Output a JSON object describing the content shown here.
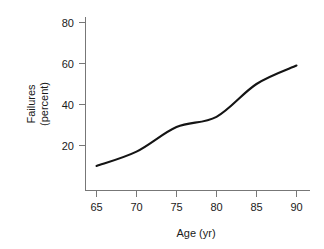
{
  "chart_data": {
    "type": "line",
    "title": "",
    "subtitle": "",
    "xlabel": "Age (yr)",
    "ylabel": "Failures (percent)",
    "ylabel_lines": [
      "Failures",
      "(percent)"
    ],
    "x": [
      65,
      70,
      75,
      80,
      85,
      90
    ],
    "values": [
      10,
      17,
      29,
      34,
      50,
      59
    ],
    "series": [
      {
        "name": "Failures",
        "values": [
          10,
          17,
          29,
          34,
          50,
          59
        ],
        "color": "#141414"
      }
    ],
    "xlim": [
      63,
      91
    ],
    "ylim": [
      5,
      85
    ],
    "xticks": [
      65,
      70,
      75,
      80,
      85,
      90
    ],
    "yticks": [
      20,
      40,
      60,
      80
    ],
    "xtick_labels": [
      "65",
      "70",
      "75",
      "80",
      "85",
      "90"
    ],
    "ytick_labels": [
      "20",
      "40",
      "60",
      "80"
    ],
    "grid": false,
    "legend": false,
    "legend_position": "none",
    "annotations": []
  },
  "axes": {
    "x_title": "Age (yr)",
    "y_title_line1": "Failures",
    "y_title_line2": "(percent)",
    "x_ticks": [
      "65",
      "70",
      "75",
      "80",
      "85",
      "90"
    ],
    "y_ticks": [
      "80",
      "60",
      "40",
      "20"
    ]
  },
  "colors": {
    "line": "#141414",
    "axis": "#777777",
    "text": "#1a1a1a",
    "background": "#ffffff"
  }
}
